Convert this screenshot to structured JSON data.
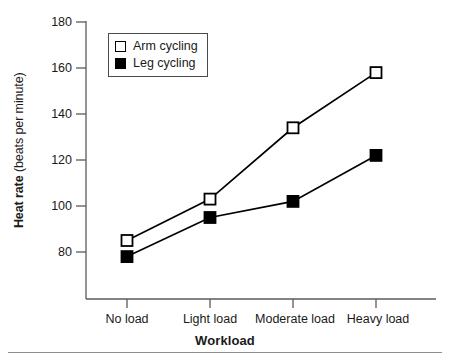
{
  "chart_data": {
    "type": "line",
    "title": "",
    "xlabel": "Workload",
    "ylabel_bold": "Heat rate",
    "ylabel_light": "(beats per minute)",
    "categories": [
      "No load",
      "Light load",
      "Moderate load",
      "Heavy load"
    ],
    "series": [
      {
        "name": "Arm cycling",
        "marker": "open-square",
        "color": "#ffffff",
        "values": [
          85,
          103,
          134,
          158
        ]
      },
      {
        "name": "Leg cycling",
        "marker": "filled-square",
        "color": "#000000",
        "values": [
          78,
          95,
          102,
          122
        ]
      }
    ],
    "ylim": [
      70,
      180
    ],
    "yticks": [
      80,
      100,
      120,
      140,
      160,
      180
    ],
    "ytick_labels": [
      "80",
      "100",
      "120",
      "140",
      "160",
      "180"
    ],
    "grid": false,
    "legend_position": "upper-left-inside"
  },
  "axes": {
    "y_title_bold": "Heat rate",
    "y_title_light": "(beats per minute)",
    "x_title": "Workload",
    "y_tick_0": "80",
    "y_tick_1": "100",
    "y_tick_2": "120",
    "y_tick_3": "140",
    "y_tick_4": "160",
    "y_tick_5": "180",
    "x_tick_0": "No load",
    "x_tick_1": "Light load",
    "x_tick_2": "Moderate load",
    "x_tick_3": "Heavy load"
  },
  "legend": {
    "entry_0": "Arm cycling",
    "entry_1": "Leg cycling"
  },
  "colors": {
    "axis": "#5a5a5a",
    "line": "#000000",
    "open_marker_fill": "#ffffff",
    "filled_marker_fill": "#000000",
    "legend_border": "#4a4a4a",
    "footer_rule": "#8d8d8d"
  }
}
